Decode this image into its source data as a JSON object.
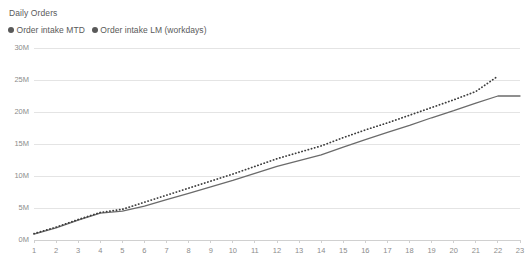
{
  "chart_title": "Daily Orders",
  "legend": {
    "position": "top-left",
    "items": [
      {
        "label": "Order intake MTD",
        "marker": "circle-dot-icon",
        "color": "#595959"
      },
      {
        "label": "Order intake LM (workdays)",
        "marker": "circle-dot-icon",
        "color": "#595959"
      }
    ]
  },
  "colors": {
    "series_mtd": "#6b6b6b",
    "series_lm": "#3d3d3d",
    "gridline": "#e4e4e4",
    "axis": "#d0d0d0",
    "tick_text": "#8c8c8c",
    "title_text": "#5a5a5a",
    "background": "#ffffff"
  },
  "chart_data": {
    "type": "line",
    "title": "Daily Orders",
    "xlabel": "",
    "ylabel": "",
    "x": [
      1,
      2,
      3,
      4,
      5,
      6,
      7,
      8,
      9,
      10,
      11,
      12,
      13,
      14,
      15,
      16,
      17,
      18,
      19,
      20,
      21,
      22,
      23
    ],
    "categories": [
      "1",
      "2",
      "3",
      "4",
      "5",
      "6",
      "7",
      "8",
      "9",
      "10",
      "11",
      "12",
      "13",
      "14",
      "15",
      "16",
      "17",
      "18",
      "19",
      "20",
      "21",
      "22",
      "23"
    ],
    "ylim": [
      0,
      30000000
    ],
    "yticks": [
      0,
      5000000,
      10000000,
      15000000,
      20000000,
      25000000,
      30000000
    ],
    "ytick_labels": [
      "0M",
      "5M",
      "10M",
      "15M",
      "20M",
      "25M",
      "30M"
    ],
    "grid": true,
    "legend_position": "top-left",
    "series": [
      {
        "name": "Order intake MTD",
        "style": "solid",
        "color": "#6b6b6b",
        "values": [
          900000,
          1900000,
          3100000,
          4200000,
          4500000,
          5300000,
          6300000,
          7300000,
          8300000,
          9300000,
          10400000,
          11500000,
          12400000,
          13300000,
          14500000,
          15700000,
          16800000,
          17900000,
          19100000,
          20200000,
          21400000,
          22500000,
          22500000
        ]
      },
      {
        "name": "Order intake LM (workdays)",
        "style": "dotted",
        "color": "#3d3d3d",
        "values": [
          1000000,
          2000000,
          3200000,
          4300000,
          4800000,
          5900000,
          7000000,
          8100000,
          9200000,
          10300000,
          11500000,
          12700000,
          13700000,
          14700000,
          16000000,
          17200000,
          18300000,
          19500000,
          20700000,
          21900000,
          23200000,
          25600000,
          null
        ]
      }
    ]
  },
  "xticks": [
    "1",
    "2",
    "3",
    "4",
    "5",
    "6",
    "7",
    "8",
    "9",
    "10",
    "11",
    "12",
    "13",
    "14",
    "15",
    "16",
    "17",
    "18",
    "19",
    "20",
    "21",
    "22",
    "23"
  ]
}
